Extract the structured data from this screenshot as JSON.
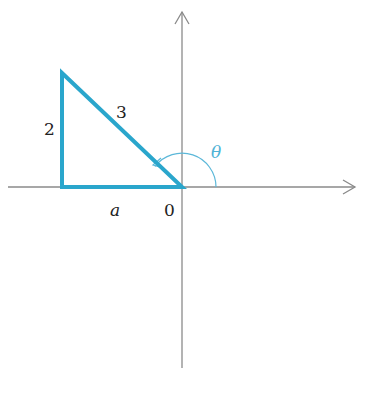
{
  "diagram": {
    "colors": {
      "axis": "#8a8a8a",
      "triangle": "#2aa6cc",
      "arc": "#5cb8d9",
      "label": "#222222",
      "theta_label": "#4fb3d6",
      "background": "#ffffff"
    },
    "axes": {
      "origin": [
        182,
        187
      ],
      "x_axis": {
        "from": [
          8,
          187
        ],
        "to": [
          355,
          187
        ],
        "arrow": "right"
      },
      "y_axis": {
        "from": [
          182,
          368
        ],
        "to": [
          182,
          12
        ],
        "arrow": "up"
      }
    },
    "triangle": {
      "vertices": [
        [
          62,
          73
        ],
        [
          62,
          187
        ],
        [
          182,
          187
        ]
      ],
      "stroke_width": 4
    },
    "angle_arc": {
      "center": [
        182,
        187
      ],
      "radius": 34,
      "start_deg": 0,
      "end_deg": 143,
      "arrowhead": true
    },
    "labels": {
      "vertical_side": "2",
      "hypotenuse": "3",
      "horizontal_side": "a",
      "origin": "0",
      "angle": "θ"
    }
  }
}
